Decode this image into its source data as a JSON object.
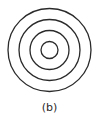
{
  "figure": {
    "label": "(b)",
    "stroke_color": "#2a2a2a",
    "center": {
      "x": 49.5,
      "y": 50
    },
    "rings": [
      {
        "r": 41.5
      },
      {
        "r": 30.5
      },
      {
        "r": 19.5
      },
      {
        "r": 8.5
      }
    ]
  }
}
